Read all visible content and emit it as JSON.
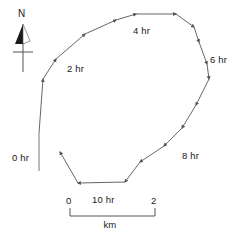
{
  "figure": {
    "kind": "storm-track-map",
    "background_color": "#ffffff",
    "line_color": "#555555",
    "text_color": "#1a1a1a"
  },
  "north_arrow": {
    "letter": "N",
    "name": "north-arrow"
  },
  "track": {
    "marker_labels": [
      {
        "id": "t0",
        "text": "0 hr",
        "x": 12,
        "y": 152
      },
      {
        "id": "t2",
        "text": "2 hr",
        "x": 67,
        "y": 63
      },
      {
        "id": "t4",
        "text": "4 hr",
        "x": 133,
        "y": 25
      },
      {
        "id": "t6",
        "text": "6 hr",
        "x": 210,
        "y": 54
      },
      {
        "id": "t8",
        "text": "8 hr",
        "x": 182,
        "y": 150
      },
      {
        "id": "t10",
        "text": "10 hr",
        "x": 92,
        "y": 194
      }
    ],
    "vertices": [
      [
        39,
        133
      ],
      [
        43,
        79
      ],
      [
        56,
        59
      ],
      [
        85,
        34
      ],
      [
        116,
        20
      ],
      [
        136,
        14
      ],
      [
        176,
        14
      ],
      [
        194,
        27
      ],
      [
        199,
        42
      ],
      [
        207,
        64
      ],
      [
        209,
        79
      ],
      [
        196,
        105
      ],
      [
        182,
        128
      ],
      [
        164,
        146
      ],
      [
        140,
        162
      ],
      [
        125,
        182
      ],
      [
        78,
        183
      ],
      [
        60,
        152
      ]
    ],
    "start_tick": {
      "x": 39,
      "y": 133,
      "length": 38
    }
  },
  "scale_bar": {
    "left_label": "0",
    "right_label": "2",
    "unit_label": "km",
    "x_start": 70,
    "x_end": 155,
    "y": 216,
    "tick_height": 8
  }
}
